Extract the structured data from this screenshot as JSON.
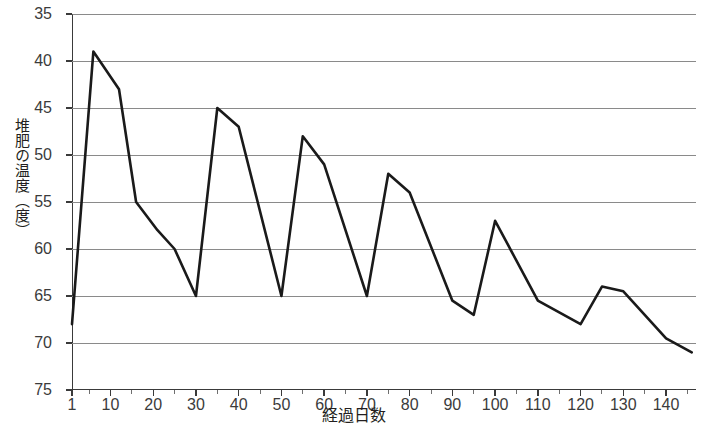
{
  "chart_data": {
    "type": "line",
    "title": "",
    "xlabel": "経過日数",
    "ylabel": "堆肥の温度（度）",
    "xlim": [
      1,
      147
    ],
    "ylim": [
      35,
      75
    ],
    "grid": true,
    "legend": "none",
    "x_ticks": [
      1,
      10,
      20,
      30,
      40,
      50,
      60,
      70,
      80,
      90,
      100,
      110,
      120,
      130,
      140
    ],
    "x_minor_tick_step": 5,
    "y_ticks": [
      35,
      40,
      45,
      50,
      55,
      60,
      65,
      70,
      75
    ],
    "series": [
      {
        "name": "堆肥の温度",
        "color": "#1a1a1a",
        "x": [
          1,
          6,
          12,
          16,
          21,
          25,
          30,
          35,
          40,
          50,
          55,
          60,
          70,
          75,
          80,
          90,
          95,
          100,
          110,
          120,
          125,
          130,
          140,
          146
        ],
        "values": [
          42,
          71,
          67,
          55,
          52,
          50,
          45,
          65,
          63,
          45,
          62,
          59,
          45,
          58,
          56,
          44.5,
          43,
          53,
          44.5,
          42,
          46,
          45.5,
          40.5,
          39
        ]
      }
    ]
  },
  "axes": {
    "y_tick_labels": [
      "75",
      "70",
      "65",
      "60",
      "55",
      "50",
      "45",
      "40",
      "35"
    ],
    "x_tick_labels": [
      "1",
      "10",
      "20",
      "30",
      "40",
      "50",
      "60",
      "70",
      "80",
      "90",
      "100",
      "110",
      "120",
      "130",
      "140"
    ],
    "y_title": "堆肥の温度（度）",
    "x_title": "経過日数"
  },
  "style": {
    "line_color": "#1a1a1a",
    "grid_color": "#8a8a8a",
    "axis_color": "#3a3a3a",
    "text_color": "#231f20",
    "background": "#ffffff"
  }
}
